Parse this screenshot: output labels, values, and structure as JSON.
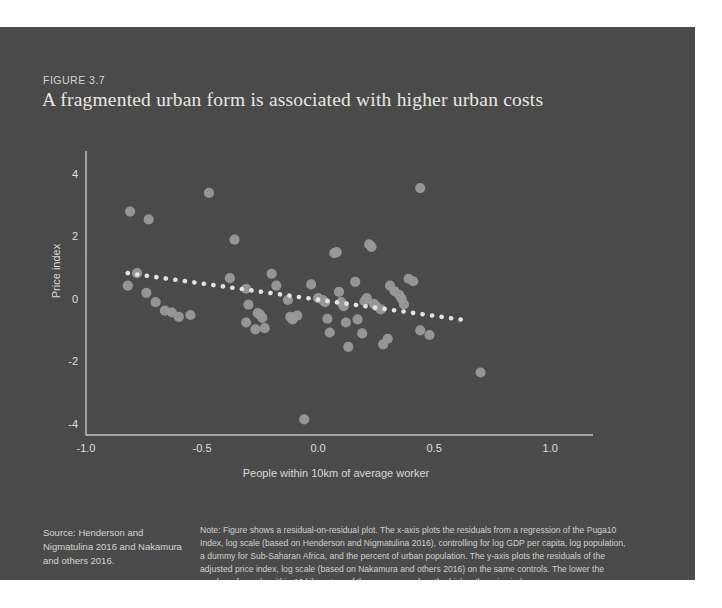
{
  "figure": {
    "label": "FIGURE 3.7",
    "title": "A fragmented urban form is associated with higher urban costs",
    "source": "Source: Henderson and Nigmatulina 2016 and Nakamura and others 2016.",
    "note": "Note: Figure shows a residual-on-residual plot. The x-axis plots the residuals from a regression of the Puga10 Index, log scale (based on Henderson and Nigmatulina 2016), controlling for log GDP per capita, log population, a dummy for Sub-Saharan Africa, and the percent of urban population. The y-axis plots the residuals of the adjusted price index, log scale (based on Nakamura and others 2016) on the same controls. The lower the number of people within 10 kilometers of the average worker, the higher the price index."
  },
  "colors": {
    "panel_background": "#4a4a4a",
    "point_fill": "#9a9a98",
    "trendline": "#e8e6e2",
    "axis": "#c9c7c3",
    "text": "#e2e0dc",
    "title_text": "#eceae6"
  },
  "chart_data": {
    "type": "scatter",
    "title": "A fragmented urban form is associated with higher urban costs",
    "xlabel": "People within 10km of average worker",
    "ylabel": "Price index",
    "xlim": [
      -1.0,
      1.15
    ],
    "ylim": [
      -4.3,
      4.5
    ],
    "xticks": [
      -1.0,
      -0.5,
      0.0,
      0.5,
      1.0
    ],
    "xtick_labels": [
      "-1.0",
      "-0.5",
      "0.0",
      "0.5",
      "1.0"
    ],
    "yticks": [
      4,
      2,
      0,
      -2,
      -4
    ],
    "ytick_labels": [
      "4",
      "2",
      "0",
      "-2",
      "-4"
    ],
    "grid": false,
    "legend": null,
    "series": [
      {
        "name": "Cities",
        "marker": "circle",
        "points": [
          [
            -0.81,
            2.85
          ],
          [
            -0.73,
            2.6
          ],
          [
            -0.47,
            3.45
          ],
          [
            0.44,
            3.6
          ],
          [
            -0.82,
            0.48
          ],
          [
            -0.78,
            0.88
          ],
          [
            -0.74,
            0.25
          ],
          [
            -0.7,
            -0.05
          ],
          [
            -0.66,
            -0.32
          ],
          [
            -0.63,
            -0.38
          ],
          [
            -0.6,
            -0.52
          ],
          [
            -0.55,
            -0.46
          ],
          [
            -0.36,
            1.95
          ],
          [
            -0.38,
            0.72
          ],
          [
            -0.31,
            0.38
          ],
          [
            -0.3,
            -0.13
          ],
          [
            -0.31,
            -0.7
          ],
          [
            -0.27,
            -0.92
          ],
          [
            -0.26,
            -0.4
          ],
          [
            -0.25,
            -0.45
          ],
          [
            -0.24,
            -0.55
          ],
          [
            -0.23,
            -0.88
          ],
          [
            -0.2,
            0.86
          ],
          [
            -0.18,
            0.48
          ],
          [
            -0.13,
            0.02
          ],
          [
            -0.12,
            -0.52
          ],
          [
            -0.11,
            -0.6
          ],
          [
            -0.09,
            -0.48
          ],
          [
            -0.06,
            -3.8
          ],
          [
            -0.03,
            0.52
          ],
          [
            0.0,
            0.08
          ],
          [
            0.02,
            0.02
          ],
          [
            0.03,
            -0.05
          ],
          [
            0.04,
            -0.58
          ],
          [
            0.05,
            -1.02
          ],
          [
            0.07,
            1.52
          ],
          [
            0.08,
            1.55
          ],
          [
            0.09,
            0.28
          ],
          [
            0.1,
            -0.05
          ],
          [
            0.11,
            -0.18
          ],
          [
            0.12,
            -0.7
          ],
          [
            0.13,
            -1.48
          ],
          [
            0.16,
            0.6
          ],
          [
            0.17,
            -0.6
          ],
          [
            0.19,
            -1.05
          ],
          [
            0.2,
            -0.02
          ],
          [
            0.21,
            0.08
          ],
          [
            0.22,
            1.8
          ],
          [
            0.23,
            1.72
          ],
          [
            0.24,
            -0.1
          ],
          [
            0.25,
            -0.18
          ],
          [
            0.27,
            -0.28
          ],
          [
            0.28,
            -1.4
          ],
          [
            0.3,
            -1.22
          ],
          [
            0.31,
            0.48
          ],
          [
            0.33,
            0.3
          ],
          [
            0.35,
            0.18
          ],
          [
            0.36,
            0.06
          ],
          [
            0.37,
            -0.12
          ],
          [
            0.39,
            0.7
          ],
          [
            0.41,
            0.62
          ],
          [
            0.44,
            -0.95
          ],
          [
            0.48,
            -1.1
          ],
          [
            0.7,
            -2.3
          ]
        ]
      }
    ],
    "trendline": {
      "style": "dotted",
      "x_start": -0.82,
      "y_start": 0.88,
      "x_end": 0.63,
      "y_end": -0.62
    }
  }
}
